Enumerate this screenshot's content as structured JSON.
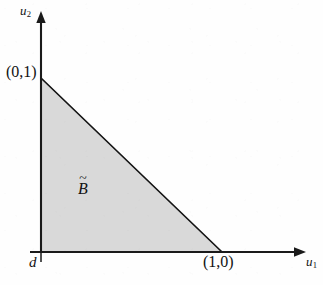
{
  "figure": {
    "kind": "math-diagram",
    "caption_present": false,
    "background_color": "#fefefe",
    "ink_color": "#121212"
  },
  "axes": {
    "x_axis": {
      "label": "u",
      "subscript": "1",
      "origin_px": [
        41,
        252
      ],
      "end_px": [
        305,
        252
      ],
      "arrow": "right"
    },
    "y_axis": {
      "label": "u",
      "subscript": "2",
      "origin_px": [
        41,
        252
      ],
      "end_px": [
        41,
        12
      ],
      "arrow": "up"
    },
    "origin_label": "d"
  },
  "region": {
    "label_base": "B",
    "label_accent": "~",
    "fill_color": "#d9d9d9",
    "stroke_color": "#141414",
    "vertices_px": [
      [
        41,
        78
      ],
      [
        41,
        252
      ],
      [
        222,
        252
      ]
    ]
  },
  "points": [
    {
      "label": "(0,1)",
      "at_px": [
        41,
        78
      ]
    },
    {
      "label": "(1,0)",
      "at_px": [
        222,
        252
      ]
    }
  ],
  "chart_data": {
    "type": "area",
    "title": "",
    "xlabel": "u1",
    "ylabel": "u2",
    "xlim": [
      0,
      1.46
    ],
    "ylim": [
      0,
      1.38
    ],
    "grid": false,
    "legend": "none",
    "annotations": [
      "(0,1)",
      "(1,0)",
      "B tilde",
      "d"
    ],
    "series": [
      {
        "name": "B tilde",
        "kind": "filled-polygon",
        "x": [
          0,
          0,
          1
        ],
        "y": [
          1,
          0,
          0
        ],
        "fill": "#d9d9d9",
        "description": "simplex u1 + u2 <= 1, u1 >= 0, u2 >= 0"
      }
    ]
  }
}
